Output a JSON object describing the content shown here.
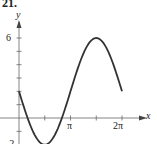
{
  "problem_number": "21.",
  "chart_data": {
    "type": "line",
    "title": "",
    "function": "y = 2 - 4 sin(x)",
    "xlabel": "x",
    "ylabel": "y",
    "x_tick_labels": [
      "π",
      "2π"
    ],
    "y_tick_labels": [
      "6",
      "-2"
    ],
    "xlim": [
      0,
      6.2832
    ],
    "ylim": [
      -2,
      6
    ],
    "grid": false,
    "legend": null,
    "series": [
      {
        "name": "curve",
        "x": [
          0,
          0.7854,
          1.5708,
          2.3562,
          3.1416,
          3.927,
          4.7124,
          5.4978,
          6.2832
        ],
        "values": [
          2,
          -0.83,
          -2,
          -0.83,
          2,
          4.83,
          6,
          4.83,
          2
        ]
      }
    ]
  },
  "labels": {
    "y_axis": "y",
    "x_axis": "x",
    "y_tick_top": "6",
    "y_tick_bottom": "-2",
    "x_tick_pi": "π",
    "x_tick_2pi": "2π"
  }
}
